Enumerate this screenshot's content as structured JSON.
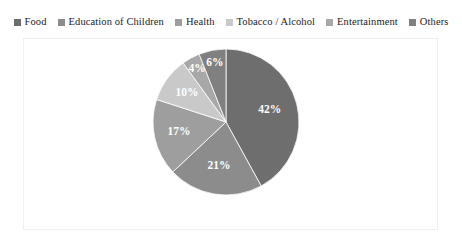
{
  "chart_data": {
    "type": "pie",
    "title": "",
    "categories": [
      "Food",
      "Education of Children",
      "Health",
      "Tobacco / Alcohol",
      "Entertainment",
      "Others"
    ],
    "values": [
      42,
      21,
      17,
      10,
      4,
      6
    ],
    "value_labels": [
      "42%",
      "21%",
      "17%",
      "10%",
      "4%",
      "6%"
    ],
    "colors": [
      "#6e6e6e",
      "#8c8c8c",
      "#9e9e9e",
      "#c9c9c9",
      "#a8a8a8",
      "#808080"
    ],
    "legend_position": "top",
    "start_angle_deg": 0,
    "direction": "clockwise",
    "units": "percent",
    "label_color": "#ffffff",
    "frame_color": "#f0f0f0",
    "background": "#ffffff"
  },
  "legend": {
    "items": [
      {
        "label": "Food",
        "color": "#6e6e6e"
      },
      {
        "label": "Education of Children",
        "color": "#8c8c8c"
      },
      {
        "label": "Health",
        "color": "#9e9e9e"
      },
      {
        "label": "Tobacco / Alcohol",
        "color": "#c9c9c9"
      },
      {
        "label": "Entertainment",
        "color": "#a8a8a8"
      },
      {
        "label": "Others",
        "color": "#808080"
      }
    ]
  },
  "slices": [
    {
      "label": "42%",
      "category": "Food"
    },
    {
      "label": "21%",
      "category": "Education of Children"
    },
    {
      "label": "17%",
      "category": "Health"
    },
    {
      "label": "10%",
      "category": "Tobacco / Alcohol"
    },
    {
      "label": "4%",
      "category": "Entertainment"
    },
    {
      "label": "6%",
      "category": "Others"
    }
  ]
}
